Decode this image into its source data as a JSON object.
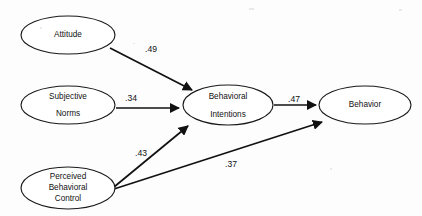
{
  "diagram": {
    "background_color": "#fdfdfd",
    "stroke_color": "#111111",
    "nodes": [
      {
        "id": "attitude",
        "lines": [
          "Attitude"
        ],
        "cx": 68,
        "cy": 35,
        "rx": 47,
        "ry": 19
      },
      {
        "id": "subjective-norms",
        "lines": [
          "Subjective",
          "Norms"
        ],
        "cx": 68,
        "cy": 105,
        "rx": 47,
        "ry": 19
      },
      {
        "id": "perceived-behavioral-control",
        "lines": [
          "Perceived",
          "Behavioral",
          "Control"
        ],
        "cx": 68,
        "cy": 188,
        "rx": 47,
        "ry": 21
      },
      {
        "id": "behavioral-intentions",
        "lines": [
          "Behavioral",
          "Intentions"
        ],
        "cx": 228,
        "cy": 105,
        "rx": 45,
        "ry": 20
      },
      {
        "id": "behavior",
        "lines": [
          "Behavior"
        ],
        "cx": 365,
        "cy": 105,
        "rx": 46,
        "ry": 19
      }
    ],
    "paths": [
      {
        "id": "attitude-to-intentions",
        "from": "attitude",
        "to": "behavioral-intentions",
        "coefficient": ".49",
        "label_x": 151,
        "label_y": 50
      },
      {
        "id": "norms-to-intentions",
        "from": "subjective-norms",
        "to": "behavioral-intentions",
        "coefficient": ".34",
        "label_x": 131,
        "label_y": 99
      },
      {
        "id": "control-to-intentions",
        "from": "perceived-behavioral-control",
        "to": "behavioral-intentions",
        "coefficient": ".43",
        "label_x": 141,
        "label_y": 154
      },
      {
        "id": "intentions-to-behavior",
        "from": "behavioral-intentions",
        "to": "behavior",
        "coefficient": ".47",
        "label_x": 294,
        "label_y": 100
      },
      {
        "id": "control-to-behavior",
        "from": "perceived-behavioral-control",
        "to": "behavior",
        "coefficient": ".37",
        "label_x": 231,
        "label_y": 165
      }
    ]
  }
}
